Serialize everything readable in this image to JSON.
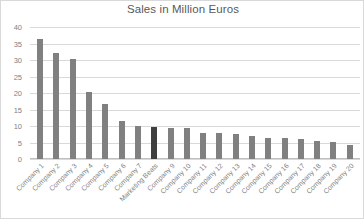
{
  "chart_data": {
    "type": "bar",
    "title": "Sales in Million Euros",
    "xlabel": "",
    "ylabel": "",
    "ylim": [
      0,
      40
    ],
    "yticks": [
      0,
      5,
      10,
      15,
      20,
      25,
      30,
      35,
      40
    ],
    "grid": true,
    "legend": false,
    "bar_color": "#808080",
    "highlight_color": "#3f3f3f",
    "highlight_category": "Marketing Beats",
    "categories": [
      "Company 1",
      "Company 2",
      "Company 3",
      "Company 4",
      "Company 5",
      "Company 6",
      "Company 7",
      "Marketing Beats",
      "Company 9",
      "Company 10",
      "Company 11",
      "Company 12",
      "Company 13",
      "Company 14",
      "Company 15",
      "Company 16",
      "Company 17",
      "Company 18",
      "Company 19",
      "Company 20"
    ],
    "values": [
      36.5,
      32,
      30.3,
      20.3,
      16.8,
      11.5,
      10,
      9.8,
      9.5,
      9.3,
      8,
      7.8,
      7.5,
      7,
      6.5,
      6.3,
      6,
      5.5,
      5.3,
      4.3
    ]
  }
}
